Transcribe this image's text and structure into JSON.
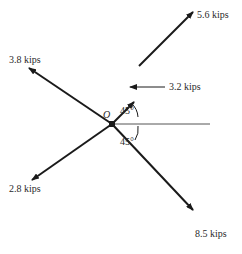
{
  "diagram": {
    "type": "force diagram",
    "origin": {
      "label": "O"
    },
    "forces": [
      {
        "id": "f56",
        "label": "5.6 kips",
        "direction": "up-right 45°"
      },
      {
        "id": "f38",
        "label": "3.8 kips",
        "direction": "up-left 45°"
      },
      {
        "id": "f28",
        "label": "2.8 kips",
        "direction": "down-left 45°"
      },
      {
        "id": "f85",
        "label": "8.5 kips",
        "direction": "down-right 45°"
      },
      {
        "id": "f32",
        "label": "3.2 kips",
        "direction": "horizontal pointing to the 45° line"
      }
    ],
    "angles": [
      {
        "id": "upper",
        "label": "45°"
      },
      {
        "id": "lower",
        "label": "45°"
      }
    ],
    "colors": {
      "line": "#1a1a1a",
      "text": "#2a2a2a",
      "background": "#ffffff"
    }
  }
}
